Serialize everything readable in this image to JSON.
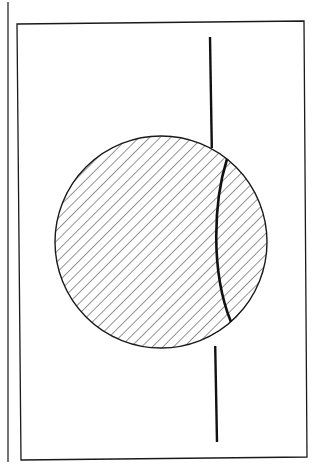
{
  "figure": {
    "colors": {
      "stroke": "#1a1a1a",
      "background": "#ffffff",
      "hatch": "#2a2a2a"
    },
    "page_margin_line": {
      "x": 8,
      "y1": 2,
      "y2": 462
    },
    "frame": {
      "points": "17,24 304,21 307,457 21,460"
    },
    "circle": {
      "cx": 161,
      "cy": 242,
      "r": 106,
      "hatch_angle": 45,
      "hatch_spacing": 7.5
    },
    "vertical_line": {
      "x1": 210,
      "y1": 37,
      "x2": 217,
      "y2": 442
    },
    "arc": {
      "path": "M227,159 C214,200 210,270 231,322"
    }
  }
}
